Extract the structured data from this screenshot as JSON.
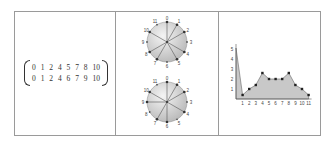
{
  "panels": {
    "matrix": {
      "rows": [
        [
          "0",
          "1",
          "2",
          "4",
          "5",
          "7",
          "8",
          "10"
        ],
        [
          "0",
          "1",
          "2",
          "4",
          "6",
          "7",
          "9",
          "10"
        ]
      ]
    },
    "circles": {
      "labels": [
        "0",
        "1",
        "2",
        "3",
        "4",
        "5",
        "6",
        "7",
        "8",
        "9",
        "10",
        "11"
      ],
      "top_spokes": [
        0,
        1,
        2,
        4,
        5,
        7,
        8,
        10
      ],
      "bottom_spokes": [
        0,
        1,
        2,
        4,
        6,
        7,
        9,
        10
      ]
    }
  },
  "chart_data": {
    "type": "area",
    "title": "",
    "xlabel": "",
    "ylabel": "",
    "x": [
      0,
      1,
      2,
      3,
      4,
      5,
      6,
      7,
      8,
      9,
      10,
      11
    ],
    "values": [
      5.1,
      0.4,
      1.0,
      1.4,
      2.6,
      2.0,
      2.0,
      2.0,
      2.6,
      1.4,
      1.0,
      0.4
    ],
    "x_tick_labels": [
      "1",
      "2",
      "3",
      "4",
      "5",
      "6",
      "7",
      "8",
      "9",
      "10",
      "11"
    ],
    "y_tick_labels": [
      "1",
      "2",
      "3",
      "4",
      "5"
    ],
    "xlim": [
      0,
      11
    ],
    "ylim": [
      0,
      5.5
    ],
    "grid": false,
    "markers": true,
    "fill_color": "#c8c8c8",
    "line_color": "#666666"
  }
}
